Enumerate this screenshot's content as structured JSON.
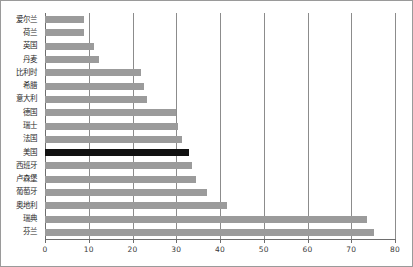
{
  "chart": {
    "type": "bar",
    "orientation": "horizontal",
    "background_color": "#ffffff",
    "bar_color": "#9b9b9b",
    "highlight_color": "#111111",
    "gridline_color": "#8c8c8c",
    "border_color": "#9a9a9a"
  },
  "chart_data": {
    "type": "bar",
    "title": "",
    "xlabel": "",
    "ylabel": "",
    "xlim": [
      0,
      80
    ],
    "grid": true,
    "legend": "none",
    "orientation": "horizontal",
    "highlight_category": "美国",
    "xticks": [
      0,
      10,
      20,
      30,
      40,
      50,
      60,
      70,
      80
    ],
    "xtick_labels": [
      "0",
      "10",
      "20",
      "30",
      "40",
      "50",
      "60",
      "70",
      "80"
    ],
    "categories": [
      "爱尔兰",
      "荷兰",
      "英国",
      "丹麦",
      "比利时",
      "希腊",
      "意大利",
      "德国",
      "瑞士",
      "法国",
      "美国",
      "西班牙",
      "卢森堡",
      "葡萄牙",
      "奥地利",
      "瑞典",
      "芬兰"
    ],
    "values": [
      9.0,
      9.0,
      11.2,
      12.3,
      22.0,
      22.6,
      23.2,
      30.0,
      30.5,
      31.2,
      33.0,
      33.5,
      34.5,
      37.0,
      41.5,
      73.6,
      75.3
    ]
  }
}
